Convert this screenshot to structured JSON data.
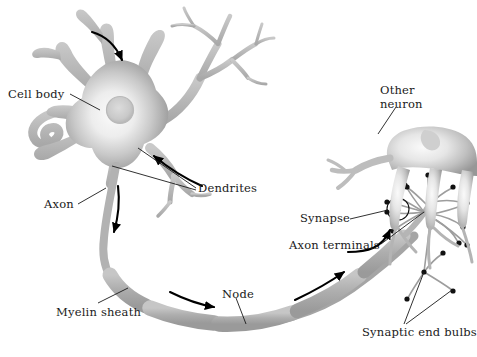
{
  "figure": {
    "background_color": "#ffffff",
    "ink_color": "#1a1a1a",
    "cell_fill_light": "#f2f2f2",
    "cell_fill_mid": "#b9b9b9",
    "cell_fill_dark": "#8f8f8f",
    "myelin_color": "#b0b0b0",
    "arrow_color": "#000000"
  },
  "labels": {
    "cell_body": "Cell body",
    "dendrites": "Dendrites",
    "axon": "Axon",
    "myelin_sheath": "Myelin sheath",
    "node": "Node",
    "other_neuron_line1": "Other",
    "other_neuron_line2": "neuron",
    "synapse": "Synapse",
    "axon_terminals": "Axon terminals",
    "synaptic_end_bulbs": "Synaptic end bulbs"
  },
  "parts": [
    {
      "name": "cell-body",
      "label": "Cell body",
      "description": "Soma with central nucleus and radiating dendrites"
    },
    {
      "name": "dendrites",
      "label": "Dendrites",
      "description": "Branched projections receiving signals"
    },
    {
      "name": "axon",
      "label": "Axon",
      "description": "Long fiber conducting impulse away from soma"
    },
    {
      "name": "myelin-sheath",
      "label": "Myelin sheath",
      "description": "Segmented insulating covering along the axon"
    },
    {
      "name": "node",
      "label": "Node",
      "description": "Gap between adjacent myelin segments"
    },
    {
      "name": "other-neuron",
      "label": "Other neuron",
      "description": "Target neuron receiving the synapse"
    },
    {
      "name": "synapse",
      "label": "Synapse",
      "description": "Junction circled between end bulb and target neuron"
    },
    {
      "name": "axon-terminals",
      "label": "Axon terminals",
      "description": "Fine branches at the end of the axon"
    },
    {
      "name": "synaptic-end-bulbs",
      "label": "Synaptic end bulbs",
      "description": "Dark knobs at the tips of the axon terminals"
    }
  ],
  "flow_arrows": [
    {
      "name": "arrow-into-dendrite",
      "direction": "down-right",
      "meaning": "signal entering dendrite"
    },
    {
      "name": "arrow-up-right-dendrite",
      "direction": "up-left",
      "meaning": "signal entering lower dendrite"
    },
    {
      "name": "arrow-down-axon",
      "direction": "down",
      "meaning": "impulse travelling down axon"
    },
    {
      "name": "arrow-along-myelin",
      "direction": "right",
      "meaning": "impulse along myelinated axon"
    },
    {
      "name": "arrow-toward-terminals",
      "direction": "right",
      "meaning": "impulse approaching terminals"
    },
    {
      "name": "arrow-into-terminals",
      "direction": "up",
      "meaning": "impulse entering axon terminals"
    }
  ],
  "label_positions": {
    "cell_body": {
      "x": 8,
      "y": 88
    },
    "dendrites": {
      "x": 196,
      "y": 190
    },
    "axon": {
      "x": 44,
      "y": 205
    },
    "myelin_sheath": {
      "x": 56,
      "y": 306
    },
    "node": {
      "x": 222,
      "y": 288
    },
    "other_neuron": {
      "x": 378,
      "y": 85
    },
    "synapse": {
      "x": 301,
      "y": 218
    },
    "axon_terminals": {
      "x": 289,
      "y": 247
    },
    "synaptic_end_bulbs": {
      "x": 362,
      "y": 333
    }
  }
}
